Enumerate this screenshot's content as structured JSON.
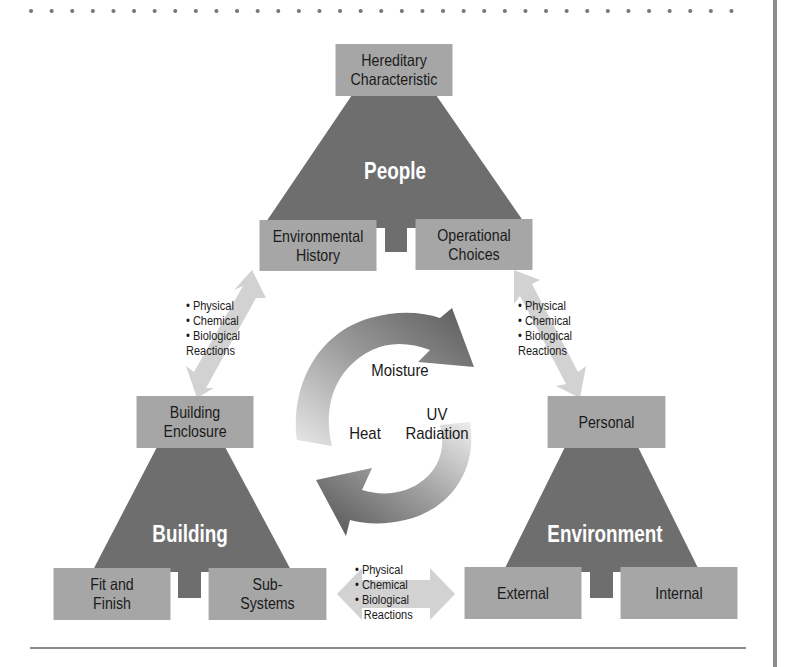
{
  "colors": {
    "box_fill": "#a6a6a6",
    "triangle_fill": "#6e6e6e",
    "arrow_light": "#d2d2d2",
    "cycle_arrow_dark": "#5a5a5a",
    "rule": "#8c8c8c"
  },
  "people": {
    "title": "People",
    "top": "Hereditary\nCharacteristic",
    "bottom_left": "Environmental\nHistory",
    "bottom_right": "Operational\nChoices"
  },
  "building": {
    "title": "Building",
    "top": "Building\nEnclosure",
    "bottom_left": "Fit and\nFinish",
    "bottom_right": "Sub-\nSystems"
  },
  "environment": {
    "title": "Environment",
    "top": "Personal",
    "bottom_left": "External",
    "bottom_right": "Internal"
  },
  "cycle": {
    "top": "Moisture",
    "left": "Heat",
    "right": "UV\nRadiation"
  },
  "reactions_left": [
    "• Physical",
    "• Chemical",
    "• Biological",
    "Reactions"
  ],
  "reactions_right": [
    "• Physical",
    "• Chemical",
    "• Biological",
    "Reactions"
  ],
  "reactions_bottom": [
    "• Physical",
    "• Chemical",
    "• Biological",
    "Reactions"
  ]
}
